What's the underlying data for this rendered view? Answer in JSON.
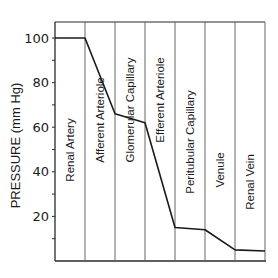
{
  "chart_data": {
    "type": "line",
    "title": "",
    "xlabel": "",
    "ylabel": "PRESSURE (mm Hg)",
    "ylim": [
      0,
      105
    ],
    "yticks": [
      20,
      40,
      60,
      80,
      100
    ],
    "grid": false,
    "legend": null,
    "segments": [
      "Renal Artery",
      "Afferent Arteriole",
      "Glomerular Capillary",
      "Efferent Arteriole",
      "Peritubular Capillary",
      "Venule",
      "Renal Vein"
    ],
    "series": [
      {
        "name": "Pressure",
        "points": [
          {
            "x": 0.0,
            "y": 100
          },
          {
            "x": 1.0,
            "y": 100
          },
          {
            "x": 2.0,
            "y": 66
          },
          {
            "x": 3.0,
            "y": 62
          },
          {
            "x": 4.0,
            "y": 15
          },
          {
            "x": 5.0,
            "y": 14
          },
          {
            "x": 6.0,
            "y": 5
          },
          {
            "x": 7.0,
            "y": 4.5
          }
        ]
      }
    ]
  }
}
